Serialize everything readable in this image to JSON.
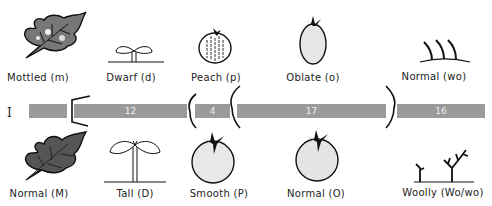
{
  "chromosome": {
    "label": "I",
    "bar_color": "#9a9a9a"
  },
  "segments": [
    {
      "id": "seg-a",
      "value": "",
      "left": 29,
      "width": 38
    },
    {
      "id": "seg-b",
      "value": "12",
      "left": 74,
      "width": 113
    },
    {
      "id": "seg-c",
      "value": "4",
      "left": 195,
      "width": 35
    },
    {
      "id": "seg-d",
      "value": "17",
      "left": 237,
      "width": 149
    },
    {
      "id": "seg-e",
      "value": "16",
      "left": 397,
      "width": 88
    }
  ],
  "top_traits": [
    {
      "name": "mottled-leaf",
      "label": "Mottled (m)",
      "x": 38
    },
    {
      "name": "dwarf-seedling",
      "label": "Dwarf (d)",
      "x": 131
    },
    {
      "name": "peach-fruit",
      "label": "Peach (p)",
      "x": 216
    },
    {
      "name": "oblate-fruit",
      "label": "Oblate (o)",
      "x": 313
    },
    {
      "name": "normal-hairs",
      "label": "Normal (wo)",
      "x": 434
    }
  ],
  "bottom_traits": [
    {
      "name": "normal-leaf",
      "label": "Normal (M)",
      "x": 39
    },
    {
      "name": "tall-seedling",
      "label": "Tall (D)",
      "x": 135
    },
    {
      "name": "smooth-fruit",
      "label": "Smooth (P)",
      "x": 219
    },
    {
      "name": "normal-fruit",
      "label": "Normal (O)",
      "x": 316
    },
    {
      "name": "woolly-hairs",
      "label": "Woolly (Wo/wo)",
      "x": 443
    }
  ]
}
